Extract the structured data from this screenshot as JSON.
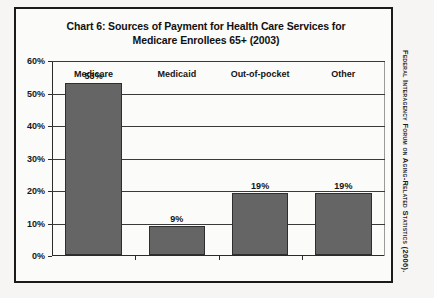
{
  "figure": {
    "title_line1": "Chart 6:  Sources of Payment for Health Care Services for",
    "title_line2": "Medicare Enrollees 65+ (2003)",
    "source_credit": "Federal Interagency Forum on Aging-Related Statistics (2006)."
  },
  "chart_data": {
    "type": "bar",
    "title": "Chart 6:  Sources of Payment for Health Care Services for Medicare Enrollees 65+ (2003)",
    "categories": [
      "Medicare",
      "Medicaid",
      "Out-of-pocket",
      "Other"
    ],
    "values": [
      53,
      9,
      19,
      19
    ],
    "value_labels": [
      "53%",
      "9%",
      "19%",
      "19%"
    ],
    "xlabel": "",
    "ylabel": "",
    "ylim": [
      0,
      60
    ],
    "ytick_values": [
      0,
      10,
      20,
      30,
      40,
      50,
      60
    ],
    "ytick_labels": [
      "0%",
      "10%",
      "20%",
      "30%",
      "40%",
      "50%",
      "60%"
    ],
    "grid": true,
    "legend": "none",
    "bar_color": "#656565",
    "bar_edge_color": "#2e2e2e",
    "axis_color": "#2b2b2b",
    "gridline_color": "#3a3a3a",
    "plot_background": "#fbfbfa",
    "units": "percent"
  }
}
